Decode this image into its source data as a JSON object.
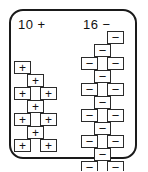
{
  "diagram": {
    "type": "connector-terminal-layout",
    "housing": {
      "shape": "rounded-rectangle",
      "stroke_color": "#1a1a1a",
      "fill_color": "#ffffff",
      "corner_radius_px": 14
    },
    "clusters": [
      {
        "id": "left",
        "label": "10 +",
        "count": 10,
        "polarity": "+",
        "glyph": "+",
        "rows": [
          {
            "row": 1,
            "cells": [
              {
                "col": "left",
                "x": 1,
                "y": 0
              }
            ]
          },
          {
            "row": 2,
            "cells": [
              {
                "col": "center",
                "x": 14,
                "y": 13
              }
            ]
          },
          {
            "row": 3,
            "cells": [
              {
                "col": "left",
                "x": 1,
                "y": 26
              },
              {
                "col": "right",
                "x": 27,
                "y": 26
              }
            ]
          },
          {
            "row": 4,
            "cells": [
              {
                "col": "center",
                "x": 14,
                "y": 39
              }
            ]
          },
          {
            "row": 5,
            "cells": [
              {
                "col": "left",
                "x": 1,
                "y": 52
              },
              {
                "col": "right",
                "x": 27,
                "y": 52
              }
            ]
          },
          {
            "row": 6,
            "cells": [
              {
                "col": "center",
                "x": 14,
                "y": 65
              }
            ]
          },
          {
            "row": 7,
            "cells": [
              {
                "col": "left",
                "x": 1,
                "y": 78
              },
              {
                "col": "right",
                "x": 27,
                "y": 78
              }
            ]
          }
        ]
      },
      {
        "id": "right",
        "label": "16 −",
        "count": 16,
        "polarity": "−",
        "glyph": "−",
        "rows": [
          {
            "row": 1,
            "cells": [
              {
                "col": "right",
                "x": 27,
                "y": 0
              }
            ]
          },
          {
            "row": 2,
            "cells": [
              {
                "col": "center",
                "x": 14,
                "y": 13
              }
            ]
          },
          {
            "row": 3,
            "cells": [
              {
                "col": "left",
                "x": 1,
                "y": 26
              },
              {
                "col": "right",
                "x": 27,
                "y": 26
              }
            ]
          },
          {
            "row": 4,
            "cells": [
              {
                "col": "center",
                "x": 14,
                "y": 39
              }
            ]
          },
          {
            "row": 5,
            "cells": [
              {
                "col": "left",
                "x": 1,
                "y": 52
              },
              {
                "col": "right",
                "x": 27,
                "y": 52
              }
            ]
          },
          {
            "row": 6,
            "cells": [
              {
                "col": "center",
                "x": 14,
                "y": 65
              }
            ]
          },
          {
            "row": 7,
            "cells": [
              {
                "col": "left",
                "x": 1,
                "y": 78
              },
              {
                "col": "right",
                "x": 27,
                "y": 78
              }
            ]
          },
          {
            "row": 8,
            "cells": [
              {
                "col": "center",
                "x": 14,
                "y": 91
              }
            ]
          },
          {
            "row": 9,
            "cells": [
              {
                "col": "left",
                "x": 1,
                "y": 104
              },
              {
                "col": "right",
                "x": 27,
                "y": 104
              }
            ]
          },
          {
            "row": 10,
            "cells": [
              {
                "col": "center",
                "x": 14,
                "y": 117
              }
            ]
          },
          {
            "row": 11,
            "cells": [
              {
                "col": "left",
                "x": 1,
                "y": 130
              },
              {
                "col": "right",
                "x": 27,
                "y": 130
              }
            ]
          }
        ]
      }
    ]
  },
  "colors": {
    "outline": "#1a1a1a",
    "terminal_stroke": "#2b2b2b",
    "glyph": "#111111",
    "background": "#ffffff"
  }
}
